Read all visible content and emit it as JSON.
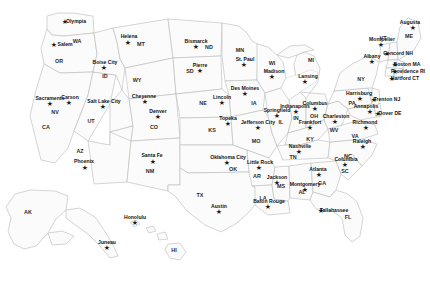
{
  "map": {
    "title": "United States — States and Capitals",
    "marker_glyph": "★",
    "colors": {
      "land": "#fbfbfb",
      "border": "#b9b9b9",
      "background": "#ffffff",
      "marker": "#1a1a1a",
      "city_text": "#111111",
      "state_text": "#2b2b2b"
    },
    "state_labels": [
      {
        "abbr": "WA",
        "x": 77,
        "y": 42
      },
      {
        "abbr": "OR",
        "x": 59,
        "y": 62
      },
      {
        "abbr": "ID",
        "x": 105,
        "y": 77
      },
      {
        "abbr": "MT",
        "x": 141,
        "y": 45
      },
      {
        "abbr": "ND",
        "x": 209,
        "y": 48
      },
      {
        "abbr": "SD",
        "x": 190,
        "y": 72
      },
      {
        "abbr": "WY",
        "x": 137,
        "y": 81
      },
      {
        "abbr": "NV",
        "x": 55,
        "y": 113
      },
      {
        "abbr": "CA",
        "x": 46,
        "y": 128
      },
      {
        "abbr": "UT",
        "x": 91,
        "y": 122
      },
      {
        "abbr": "CO",
        "x": 154,
        "y": 128
      },
      {
        "abbr": "NE",
        "x": 203,
        "y": 104
      },
      {
        "abbr": "KS",
        "x": 212,
        "y": 131
      },
      {
        "abbr": "AZ",
        "x": 80,
        "y": 152
      },
      {
        "abbr": "NM",
        "x": 150,
        "y": 172
      },
      {
        "abbr": "OK",
        "x": 233,
        "y": 170
      },
      {
        "abbr": "TX",
        "x": 200,
        "y": 196
      },
      {
        "abbr": "MN",
        "x": 240,
        "y": 51
      },
      {
        "abbr": "IA",
        "x": 254,
        "y": 104
      },
      {
        "abbr": "MO",
        "x": 256,
        "y": 142
      },
      {
        "abbr": "AR",
        "x": 257,
        "y": 177
      },
      {
        "abbr": "LA",
        "x": 263,
        "y": 199
      },
      {
        "abbr": "WI",
        "x": 272,
        "y": 64
      },
      {
        "abbr": "IL",
        "x": 281,
        "y": 123
      },
      {
        "abbr": "MS",
        "x": 281,
        "y": 187
      },
      {
        "abbr": "MI",
        "x": 311,
        "y": 61
      },
      {
        "abbr": "IN",
        "x": 296,
        "y": 119
      },
      {
        "abbr": "KY",
        "x": 310,
        "y": 140
      },
      {
        "abbr": "TN",
        "x": 293,
        "y": 158
      },
      {
        "abbr": "AL",
        "x": 302,
        "y": 193
      },
      {
        "abbr": "OH",
        "x": 314,
        "y": 117
      },
      {
        "abbr": "GA",
        "x": 322,
        "y": 184
      },
      {
        "abbr": "FL",
        "x": 348,
        "y": 218
      },
      {
        "abbr": "WV",
        "x": 334,
        "y": 131
      },
      {
        "abbr": "SC",
        "x": 345,
        "y": 172
      },
      {
        "abbr": "NC",
        "x": 348,
        "y": 157
      },
      {
        "abbr": "VA",
        "x": 355,
        "y": 137
      },
      {
        "abbr": "PA",
        "x": 352,
        "y": 104
      },
      {
        "abbr": "NY",
        "x": 361,
        "y": 80
      },
      {
        "abbr": "VT",
        "x": 383,
        "y": 39
      },
      {
        "abbr": "ME",
        "x": 409,
        "y": 37
      },
      {
        "abbr": "AK",
        "x": 28,
        "y": 213
      },
      {
        "abbr": "HI",
        "x": 174,
        "y": 251
      }
    ],
    "capitals": [
      {
        "city": "Olympia",
        "x": 65,
        "y": 22,
        "lx": 76,
        "ly": 22
      },
      {
        "city": "Salem",
        "x": 54,
        "y": 45,
        "lx": 65,
        "ly": 45
      },
      {
        "city": "Boise City",
        "x": 104,
        "y": 68,
        "lx": 105,
        "ly": 63
      },
      {
        "city": "Helena",
        "x": 128,
        "y": 43,
        "lx": 129,
        "ly": 37
      },
      {
        "city": "Bismarck",
        "x": 196,
        "y": 47,
        "lx": 196,
        "ly": 42
      },
      {
        "city": "Pierre",
        "x": 200,
        "y": 71,
        "lx": 200,
        "ly": 66
      },
      {
        "city": "St. Paul",
        "x": 244,
        "y": 65,
        "lx": 245,
        "ly": 60
      },
      {
        "city": "Madison",
        "x": 272,
        "y": 77,
        "lx": 274,
        "ly": 72
      },
      {
        "city": "Lansing",
        "x": 305,
        "y": 82,
        "lx": 308,
        "ly": 77
      },
      {
        "city": "Augusta",
        "x": 413,
        "y": 28,
        "lx": 410,
        "ly": 23
      },
      {
        "city": "Montpelier",
        "x": 381,
        "y": 45,
        "lx": 382,
        "ly": 40
      },
      {
        "city": "Concord NH",
        "x": 387,
        "y": 54,
        "lx": 398,
        "ly": 54
      },
      {
        "city": "Albany",
        "x": 372,
        "y": 62,
        "lx": 372,
        "ly": 57
      },
      {
        "city": "Boston MA",
        "x": 395,
        "y": 65,
        "lx": 407,
        "ly": 65
      },
      {
        "city": "Providence RI",
        "x": 395,
        "y": 72,
        "lx": 408,
        "ly": 72
      },
      {
        "city": "Hartford CT",
        "x": 392,
        "y": 79,
        "lx": 405,
        "ly": 79
      },
      {
        "city": "Harrisburg",
        "x": 360,
        "y": 99,
        "lx": 359,
        "ly": 94
      },
      {
        "city": "Trenton NJ",
        "x": 374,
        "y": 100,
        "lx": 387,
        "ly": 100
      },
      {
        "city": "Annapolis",
        "x": 370,
        "y": 112,
        "lx": 366,
        "ly": 107
      },
      {
        "city": "Dover DE",
        "x": 378,
        "y": 114,
        "lx": 390,
        "ly": 114
      },
      {
        "city": "Richmond",
        "x": 366,
        "y": 128,
        "lx": 365,
        "ly": 123
      },
      {
        "city": "Charleston",
        "x": 335,
        "y": 122,
        "lx": 336,
        "ly": 117
      },
      {
        "city": "Raleigh",
        "x": 363,
        "y": 147,
        "lx": 362,
        "ly": 142
      },
      {
        "city": "Columbia",
        "x": 345,
        "y": 165,
        "lx": 346,
        "ly": 160
      },
      {
        "city": "Atlanta",
        "x": 319,
        "y": 175,
        "lx": 318,
        "ly": 170
      },
      {
        "city": "Tallahassee",
        "x": 321,
        "y": 211,
        "lx": 334,
        "ly": 211
      },
      {
        "city": "Montgomery",
        "x": 305,
        "y": 190,
        "lx": 305,
        "ly": 185
      },
      {
        "city": "Jackson",
        "x": 277,
        "y": 183,
        "lx": 277,
        "ly": 178
      },
      {
        "city": "Baton Rouge",
        "x": 268,
        "y": 207,
        "lx": 269,
        "ly": 202
      },
      {
        "city": "Austin",
        "x": 219,
        "y": 212,
        "lx": 219,
        "ly": 207
      },
      {
        "city": "Oklahoma City",
        "x": 227,
        "y": 163,
        "lx": 228,
        "ly": 158
      },
      {
        "city": "Little Rock",
        "x": 259,
        "y": 168,
        "lx": 260,
        "ly": 163
      },
      {
        "city": "Jefferson City",
        "x": 258,
        "y": 128,
        "lx": 258,
        "ly": 123
      },
      {
        "city": "Springfield",
        "x": 277,
        "y": 116,
        "lx": 277,
        "ly": 111
      },
      {
        "city": "Indianapolis",
        "x": 296,
        "y": 112,
        "lx": 295,
        "ly": 107
      },
      {
        "city": "Columbus",
        "x": 315,
        "y": 109,
        "lx": 315,
        "ly": 104
      },
      {
        "city": "Frankfort",
        "x": 310,
        "y": 128,
        "lx": 310,
        "ly": 123
      },
      {
        "city": "Nashville",
        "x": 299,
        "y": 152,
        "lx": 300,
        "ly": 147
      },
      {
        "city": "Topeka",
        "x": 228,
        "y": 124,
        "lx": 228,
        "ly": 119
      },
      {
        "city": "Lincoln",
        "x": 222,
        "y": 103,
        "lx": 222,
        "ly": 98
      },
      {
        "city": "Des Moines",
        "x": 245,
        "y": 94,
        "lx": 245,
        "ly": 89
      },
      {
        "city": "Cheyenne",
        "x": 145,
        "y": 102,
        "lx": 144,
        "ly": 97
      },
      {
        "city": "Denver",
        "x": 158,
        "y": 117,
        "lx": 158,
        "ly": 112
      },
      {
        "city": "Santa Fe",
        "x": 153,
        "y": 162,
        "lx": 152,
        "ly": 156
      },
      {
        "city": "Salt Lake City",
        "x": 103,
        "y": 107,
        "lx": 104,
        "ly": 102
      },
      {
        "city": "Carson",
        "x": 69,
        "y": 103,
        "lx": 70,
        "ly": 98
      },
      {
        "city": "Sacramento",
        "x": 50,
        "y": 104,
        "lx": 50,
        "ly": 99
      },
      {
        "city": "Phoenix",
        "x": 85,
        "y": 168,
        "lx": 84,
        "ly": 162
      },
      {
        "city": "Juneau",
        "x": 107,
        "y": 248,
        "lx": 107,
        "ly": 243
      },
      {
        "city": "Honolulu",
        "x": 135,
        "y": 223,
        "lx": 135,
        "ly": 218
      }
    ]
  }
}
